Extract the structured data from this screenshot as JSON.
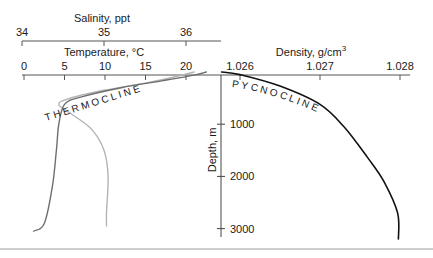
{
  "chart_data": {
    "type": "line",
    "title": "",
    "y_axis": {
      "label": "Depth, m",
      "ticks": [
        1000,
        2000,
        3000
      ],
      "tick_labels": [
        "1000",
        "2000",
        "3000"
      ],
      "range": [
        0,
        3200
      ],
      "inverted": true
    },
    "x_axes": [
      {
        "id": "salinity",
        "label": "Salinity, ppt",
        "ticks": [
          34,
          35,
          36
        ],
        "tick_labels": [
          "34",
          "35",
          "36"
        ],
        "range": [
          34,
          36.15
        ]
      },
      {
        "id": "temperature",
        "label": "Temperature, °C",
        "ticks": [
          0,
          5,
          10,
          15,
          20
        ],
        "tick_labels": [
          "0",
          "5",
          "10",
          "15",
          "20"
        ],
        "range": [
          -0.3,
          24.5
        ]
      },
      {
        "id": "density",
        "label": "Density, g/cm",
        "label_superscript": "3",
        "ticks": [
          1.026,
          1.027,
          1.028
        ],
        "tick_labels": [
          "1.026",
          "1.027",
          "1.028"
        ],
        "range": [
          1.02575,
          1.0281
        ]
      }
    ],
    "series": [
      {
        "name": "Temperature",
        "axis": "temperature",
        "color": "#6e6e6e",
        "points": [
          [
            22.5,
            0
          ],
          [
            21,
            60
          ],
          [
            17,
            170
          ],
          [
            12,
            300
          ],
          [
            7,
            480
          ],
          [
            5,
            620
          ],
          [
            4.3,
            1000
          ],
          [
            4,
            1500
          ],
          [
            3.5,
            2200
          ],
          [
            2.5,
            2900
          ],
          [
            1.2,
            3050
          ]
        ]
      },
      {
        "name": "Salinity",
        "axis": "salinity",
        "color": "#b4b4b4",
        "points": [
          [
            36.1,
            0
          ],
          [
            35.95,
            60
          ],
          [
            35.55,
            200
          ],
          [
            35.0,
            350
          ],
          [
            34.55,
            520
          ],
          [
            34.45,
            630
          ],
          [
            34.6,
            800
          ],
          [
            34.85,
            1100
          ],
          [
            35.0,
            1500
          ],
          [
            35.05,
            2000
          ],
          [
            35.03,
            2700
          ],
          [
            35.03,
            2950
          ]
        ]
      },
      {
        "name": "Density",
        "axis": "density",
        "color": "#111111",
        "points": [
          [
            1.02577,
            0
          ],
          [
            1.026,
            50
          ],
          [
            1.0265,
            270
          ],
          [
            1.027,
            620
          ],
          [
            1.0273,
            1050
          ],
          [
            1.0276,
            1650
          ],
          [
            1.0278,
            2100
          ],
          [
            1.02797,
            2700
          ],
          [
            1.02798,
            3200
          ]
        ]
      }
    ],
    "annotations": [
      {
        "id": "thermocline",
        "text": "THERMOCLINE"
      },
      {
        "id": "pycnocline",
        "text": "PYCNOCLINE"
      }
    ],
    "grid": false,
    "legend": "none"
  }
}
